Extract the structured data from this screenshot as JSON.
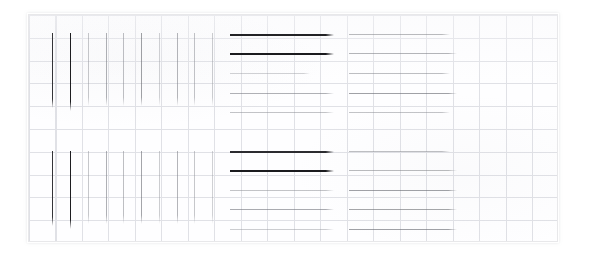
{
  "document": {
    "kind": "scanned-print-quality-test-chart",
    "page_background": "#ffffff",
    "frame": {
      "x": 28,
      "y": 14,
      "width": 530,
      "height": 228,
      "border_color": "#e8e8ea",
      "fill_color": "#fefeff"
    },
    "grid": {
      "visible": true,
      "color": "#c4c6ce",
      "cell_width": 26.5,
      "cell_height": 22.8,
      "columns": 20,
      "rows": 10
    }
  },
  "chart_data": {
    "type": "scatter",
    "title": "",
    "subtitle": "",
    "xlabel": "",
    "ylabel": "",
    "grid": true,
    "legend_position": "none",
    "xlim": [
      0,
      530
    ],
    "ylim": [
      0,
      228
    ],
    "blocks": [
      {
        "name": "upper-vertical-rules",
        "orientation": "vertical",
        "x_start": 28,
        "y_top": 32,
        "y_bottom": 107,
        "marks": [
          {
            "pos": 51,
            "length": 75,
            "darkness": 0.88,
            "color": "#2c2c30"
          },
          {
            "pos": 69,
            "length": 78,
            "darkness": 0.95,
            "color": "#1d1d20"
          },
          {
            "pos": 87,
            "length": 73,
            "darkness": 0.42,
            "color": "#8e9096"
          },
          {
            "pos": 105,
            "length": 73,
            "darkness": 0.52,
            "color": "#7a7c84"
          },
          {
            "pos": 122,
            "length": 73,
            "darkness": 0.46,
            "color": "#86888f"
          },
          {
            "pos": 140,
            "length": 73,
            "darkness": 0.58,
            "color": "#6e7076"
          },
          {
            "pos": 158,
            "length": 73,
            "darkness": 0.38,
            "color": "#999ba1"
          },
          {
            "pos": 176,
            "length": 73,
            "darkness": 0.5,
            "color": "#7e8087"
          },
          {
            "pos": 193,
            "length": 73,
            "darkness": 0.44,
            "color": "#8a8c93"
          },
          {
            "pos": 211,
            "length": 73,
            "darkness": 0.4,
            "color": "#94969c"
          }
        ]
      },
      {
        "name": "upper-horizontal-rules-left",
        "orientation": "horizontal",
        "x_start": 229,
        "marks": [
          {
            "pos": 33,
            "length": 104,
            "darkness": 0.92,
            "color": "#232326"
          },
          {
            "pos": 52,
            "length": 104,
            "darkness": 0.95,
            "color": "#1b1b1e"
          },
          {
            "pos": 72,
            "length": 80,
            "darkness": 0.38,
            "color": "#9a9ca2"
          },
          {
            "pos": 92,
            "length": 104,
            "darkness": 0.52,
            "color": "#7b7d84"
          },
          {
            "pos": 111,
            "length": 104,
            "darkness": 0.44,
            "color": "#8b8d93"
          }
        ]
      },
      {
        "name": "upper-horizontal-rules-right",
        "orientation": "horizontal",
        "x_start": 348,
        "marks": [
          {
            "pos": 33,
            "length": 101,
            "darkness": 0.48,
            "color": "#838589"
          },
          {
            "pos": 52,
            "length": 108,
            "darkness": 0.5,
            "color": "#7e8086"
          },
          {
            "pos": 72,
            "length": 101,
            "darkness": 0.46,
            "color": "#86888e"
          },
          {
            "pos": 92,
            "length": 108,
            "darkness": 0.58,
            "color": "#6f7178"
          },
          {
            "pos": 111,
            "length": 101,
            "darkness": 0.44,
            "color": "#8b8d93"
          }
        ]
      },
      {
        "name": "lower-vertical-rules",
        "orientation": "vertical",
        "x_start": 28,
        "y_top": 150,
        "y_bottom": 225,
        "marks": [
          {
            "pos": 51,
            "length": 75,
            "darkness": 0.88,
            "color": "#2c2c30"
          },
          {
            "pos": 69,
            "length": 78,
            "darkness": 0.95,
            "color": "#1d1d20"
          },
          {
            "pos": 87,
            "length": 73,
            "darkness": 0.42,
            "color": "#8e9096"
          },
          {
            "pos": 105,
            "length": 73,
            "darkness": 0.52,
            "color": "#7a7c84"
          },
          {
            "pos": 122,
            "length": 73,
            "darkness": 0.46,
            "color": "#86888f"
          },
          {
            "pos": 140,
            "length": 73,
            "darkness": 0.56,
            "color": "#71737a"
          },
          {
            "pos": 158,
            "length": 73,
            "darkness": 0.4,
            "color": "#95979d"
          },
          {
            "pos": 176,
            "length": 73,
            "darkness": 0.5,
            "color": "#7e8087"
          },
          {
            "pos": 193,
            "length": 73,
            "darkness": 0.42,
            "color": "#8e9096"
          },
          {
            "pos": 211,
            "length": 73,
            "darkness": 0.38,
            "color": "#999ba1"
          }
        ]
      },
      {
        "name": "lower-horizontal-rules-left",
        "orientation": "horizontal",
        "x_start": 229,
        "marks": [
          {
            "pos": 150,
            "length": 104,
            "darkness": 0.9,
            "color": "#28282c"
          },
          {
            "pos": 169,
            "length": 104,
            "darkness": 0.95,
            "color": "#1b1b1e"
          },
          {
            "pos": 189,
            "length": 104,
            "darkness": 0.44,
            "color": "#8b8d93"
          },
          {
            "pos": 208,
            "length": 104,
            "darkness": 0.54,
            "color": "#767880"
          },
          {
            "pos": 228,
            "length": 104,
            "darkness": 0.4,
            "color": "#95979d"
          }
        ]
      },
      {
        "name": "lower-horizontal-rules-right",
        "orientation": "horizontal",
        "x_start": 348,
        "marks": [
          {
            "pos": 150,
            "length": 101,
            "darkness": 0.46,
            "color": "#86888e"
          },
          {
            "pos": 169,
            "length": 108,
            "darkness": 0.48,
            "color": "#838589"
          },
          {
            "pos": 189,
            "length": 108,
            "darkness": 0.58,
            "color": "#6f7178"
          },
          {
            "pos": 208,
            "length": 108,
            "darkness": 0.56,
            "color": "#737579"
          },
          {
            "pos": 228,
            "length": 108,
            "darkness": 0.58,
            "color": "#6f7178"
          }
        ]
      }
    ]
  }
}
